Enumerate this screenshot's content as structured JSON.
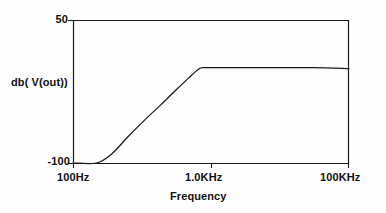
{
  "chart_data": {
    "type": "line",
    "title": "",
    "subtitle": "",
    "xlabel": "Frequency",
    "ylabel": "db( V(out))",
    "xscale": "log",
    "xlim": [
      100,
      100000
    ],
    "ylim": [
      -100,
      50
    ],
    "grid": false,
    "legend": null,
    "x_tick_labels": [
      "100Hz",
      "1.0KHz",
      "100KHz"
    ],
    "x_tick_values": [
      100,
      1000,
      100000
    ],
    "y_tick_labels": [
      "50",
      "-100"
    ],
    "y_tick_values": [
      50,
      -100
    ],
    "annotations": [],
    "series": [
      {
        "name": "db( V(out))",
        "color": "#1a1a1a",
        "x": [
          100,
          180,
          260,
          400,
          600,
          900,
          1300,
          1800,
          2300,
          2600,
          4000,
          10000,
          40000,
          100000
        ],
        "y": [
          -100,
          -100,
          -91,
          -72,
          -55,
          -39,
          -24,
          -11,
          -2,
          0,
          0,
          0,
          0,
          -1
        ]
      }
    ]
  },
  "axes": {
    "y_max_label": "50",
    "y_min_label": "-100",
    "y_axis_title": "db( V(out))",
    "x_left_label": "100Hz",
    "x_mid_label": "1.0KHz",
    "x_right_label": "100KHz",
    "x_axis_title": "Frequency"
  },
  "colors": {
    "line": "#1a1a1a",
    "axis": "#1a1a1a",
    "text": "#101010",
    "background": "#fefefe"
  }
}
